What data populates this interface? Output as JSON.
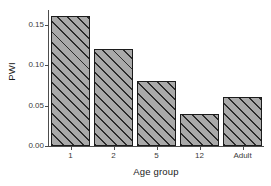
{
  "chart_data": {
    "type": "bar",
    "title": "",
    "subtitle": "",
    "xlabel": "Age group",
    "ylabel": "PWI",
    "categories": [
      "1",
      "2",
      "5",
      "12",
      "Adult"
    ],
    "values": [
      0.16,
      0.12,
      0.08,
      0.04,
      0.06
    ],
    "series": [
      {
        "name": "PWI",
        "values": [
          0.16,
          0.12,
          0.08,
          0.04,
          0.06
        ]
      }
    ],
    "ylim": [
      0.0,
      0.168
    ],
    "xlim": [
      0,
      5
    ],
    "y_ticks": [
      0.0,
      0.05,
      0.1,
      0.15
    ],
    "y_tick_labels": [
      "0.00",
      "0.05",
      "0.10",
      "0.15"
    ],
    "x_tick_labels": [
      "1",
      "2",
      "5",
      "12",
      "Adult"
    ],
    "grid": false,
    "legend": false,
    "legend_position": "none",
    "annotations": [],
    "style": {
      "background": "#ffffff",
      "bar_fill": "#a9a9a9",
      "bar_hatch_color": "#2b2b2b",
      "bar_hatch_pattern": "diagonal-45",
      "bar_border": "#1c1c1c",
      "axis_color": "#4d4d4d",
      "tick_label_color": "#3a3a3a",
      "axis_title_color": "#1a1a1a"
    }
  }
}
